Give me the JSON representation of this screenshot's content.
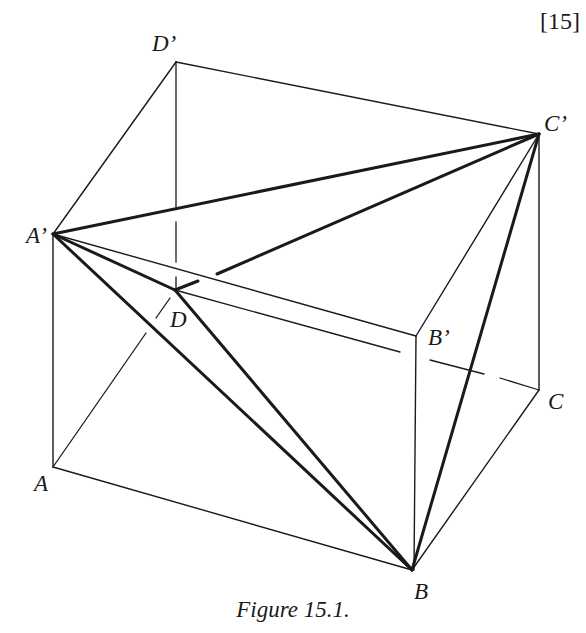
{
  "figure": {
    "reference": "[15]",
    "caption": "Figure 15.1.",
    "vertices": {
      "A": {
        "label": "A",
        "x": 53,
        "y": 467
      },
      "B": {
        "label": "B",
        "x": 412,
        "y": 570
      },
      "C": {
        "label": "C",
        "x": 539,
        "y": 390
      },
      "D": {
        "label": "D",
        "x": 175,
        "y": 290
      },
      "A_prime": {
        "label": "A’",
        "x": 53,
        "y": 234
      },
      "B_prime": {
        "label": "B’",
        "x": 416,
        "y": 336
      },
      "C_prime": {
        "label": "C’",
        "x": 539,
        "y": 134
      },
      "D_prime": {
        "label": "D’",
        "x": 176,
        "y": 62
      }
    },
    "edges_thin": [
      "A-B",
      "B-C",
      "A-A'",
      "B-B'",
      "C-C'",
      "A'-B'",
      "B'-C'",
      "C'-D'",
      "D'-A'"
    ],
    "edges_hidden": [
      "A-D",
      "D-D'",
      "D-C"
    ],
    "edges_thick": [
      "A'-C'",
      "A'-B",
      "A'-D",
      "D-B",
      "B-C'",
      "D-C'"
    ]
  }
}
